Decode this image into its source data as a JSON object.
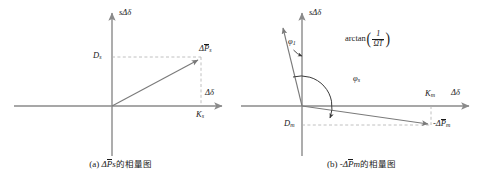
{
  "figure": {
    "panels": [
      {
        "id": "a",
        "caption_index": "(a)",
        "caption_math_delta": "Δ",
        "caption_math_p": "P",
        "caption_math_sub": "s",
        "caption_cn": "的相量图",
        "axis_y_label_s": "s",
        "axis_y_label_delta": "Δδ",
        "axis_x_label": "Δδ",
        "vector_label_prefix": "Δ",
        "vector_label_p": "P",
        "vector_label_sub": "s",
        "y_projection_label": "D",
        "y_projection_sub": "s",
        "x_projection_label": "K",
        "x_projection_sub": "s"
      },
      {
        "id": "b",
        "caption_index": "(b)",
        "caption_math_delta": "-Δ",
        "caption_math_p": "P",
        "caption_math_sub": "m",
        "caption_cn": "的相量图",
        "axis_y_label_s": "s",
        "axis_y_label_delta": "Δδ",
        "axis_x_label": "Δδ",
        "vector_label_prefix": "-Δ",
        "vector_label_p": "P",
        "vector_label_sub": "m",
        "y_projection_label": "D",
        "y_projection_sub": "m",
        "x_projection_label": "K",
        "x_projection_sub": "m",
        "angle_1_symbol": "φ",
        "angle_1_sub": "1",
        "angle_s_symbol": "φ",
        "angle_s_sub": "s",
        "arctan_name": "arctan",
        "arctan_paren_open": "(",
        "arctan_paren_close": ")",
        "arctan_numerator": "1",
        "arctan_denominator": "ΩT"
      }
    ],
    "colors": {
      "axis": "#8a8a8a",
      "vector": "#7a7a7a",
      "dashed": "#b0b0b0",
      "text": "#1a1a1a"
    }
  }
}
